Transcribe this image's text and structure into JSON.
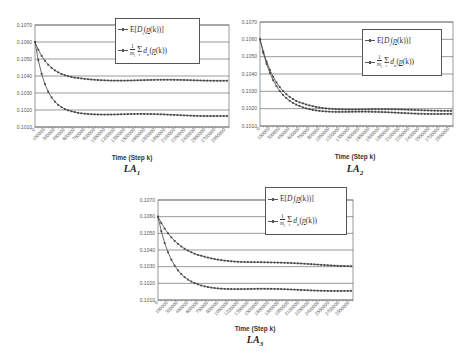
{
  "chart_data": [
    {
      "id": "LA1",
      "type": "line",
      "caption": "LA",
      "caption_sub": "1",
      "xlabel": "Time (Step k)",
      "ylabel": "",
      "ylim": [
        0.101,
        0.107
      ],
      "yticks": [
        "0.1010",
        "0.1020",
        "0.1030",
        "0.1040",
        "0.1050",
        "0.1060",
        "0.1070"
      ],
      "xticks": [
        "0",
        "150000",
        "300000",
        "450000",
        "600000",
        "750000",
        "900000",
        "1050000",
        "1200000",
        "1350000",
        "1500000",
        "1650000",
        "1800000",
        "1950000",
        "2100000",
        "2250000",
        "2400000",
        "2550000",
        "2700000",
        "2850000"
      ],
      "xlim": [
        0,
        2900000
      ],
      "grid": true,
      "legend_position": "top-right",
      "series": [
        {
          "name": "E[D_i(p(k))]",
          "start": 0.106,
          "settle": 0.10375,
          "tau": 220000,
          "end": 0.10375
        },
        {
          "name": "(1/m_i) Σ_r d_ir(p(k))",
          "start": 0.106,
          "settle": 0.10175,
          "tau": 170000,
          "end": 0.10165
        }
      ]
    },
    {
      "id": "LA2",
      "type": "line",
      "caption": "LA",
      "caption_sub": "2",
      "xlabel": "Time (Step k)",
      "ylabel": "",
      "ylim": [
        0.101,
        0.107
      ],
      "yticks": [
        "0.1010",
        "0.1020",
        "0.1030",
        "0.1040",
        "0.1050",
        "0.1060",
        "0.1070"
      ],
      "xticks": [
        "0",
        "150000",
        "300000",
        "450000",
        "600000",
        "750000",
        "900000",
        "1050000",
        "1200000",
        "1350000",
        "1500000",
        "1650000",
        "1800000",
        "1950000",
        "2100000",
        "2250000",
        "2400000",
        "2550000",
        "2700000",
        "2850000"
      ],
      "xlim": [
        0,
        2900000
      ],
      "grid": true,
      "legend_position": "top-right",
      "series": [
        {
          "name": "E[D_i(p(k))]",
          "start": 0.106,
          "settle": 0.10195,
          "tau": 260000,
          "end": 0.1019
        },
        {
          "name": "(1/m_i) Σ_r d_ir(p(k))",
          "start": 0.106,
          "settle": 0.1018,
          "tau": 240000,
          "end": 0.1017
        }
      ]
    },
    {
      "id": "LA3",
      "type": "line",
      "caption": "LA",
      "caption_sub": "3",
      "xlabel": "Time (Step k)",
      "ylabel": "",
      "ylim": [
        0.101,
        0.107
      ],
      "yticks": [
        "0.1010",
        "0.1020",
        "0.1030",
        "0.1040",
        "0.1050",
        "0.1060",
        "0.1070"
      ],
      "xticks": [
        "0",
        "150000",
        "300000",
        "450000",
        "600000",
        "750000",
        "900000",
        "1050000",
        "1200000",
        "1350000",
        "1500000",
        "1650000",
        "1800000",
        "1950000",
        "2100000",
        "2250000",
        "2400000",
        "2550000",
        "2700000",
        "2850000"
      ],
      "xlim": [
        0,
        2900000
      ],
      "grid": true,
      "legend_position": "top-right",
      "series": [
        {
          "name": "E[D_i(p(k))]",
          "start": 0.106,
          "settle": 0.10325,
          "tau": 330000,
          "end": 0.10305
        },
        {
          "name": "(1/m_i) Σ_r d_ir(p(k))",
          "start": 0.106,
          "settle": 0.10165,
          "tau": 220000,
          "end": 0.10155
        }
      ]
    }
  ],
  "legend": {
    "series1": {
      "prefix": "E",
      "var": "D",
      "sub": "i",
      "arg": "p",
      "argk": "(k)"
    },
    "series2": {
      "num": "1",
      "den": "m",
      "den_sub": "i",
      "sum_sub": "r",
      "var": "d",
      "sub": "ir",
      "arg": "p",
      "argk": "(k)"
    }
  },
  "colors": {
    "line": "#444444",
    "grid": "#555555",
    "axis": "#555555",
    "text": "#333333"
  }
}
